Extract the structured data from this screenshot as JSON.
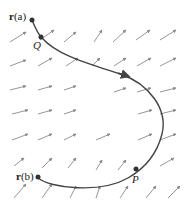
{
  "diagram": {
    "type": "vector-field-with-curve",
    "curve_color": "#444444",
    "arrow_color": "#8a8a8a",
    "point_color": "#333333",
    "labels": {
      "start": {
        "bold": "r",
        "rest": "(a)"
      },
      "end": {
        "bold": "r",
        "rest": "(b)"
      },
      "Q": "Q",
      "P": "P"
    }
  }
}
